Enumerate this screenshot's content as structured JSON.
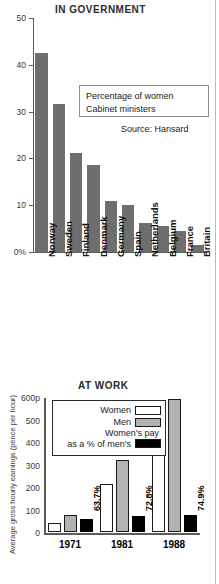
{
  "chart_data": [
    {
      "type": "bar",
      "title": "IN GOVERNMENT",
      "categories": [
        "Norway",
        "Sweden",
        "Finland",
        "Denmark",
        "Germany",
        "Spain",
        "Netherlands",
        "Belgium",
        "France",
        "Britain"
      ],
      "values": [
        42.5,
        31.7,
        21.2,
        18.5,
        10.9,
        10.0,
        6.2,
        5.5,
        4.5,
        1.4
      ],
      "ylim": [
        0,
        50
      ],
      "yticks": [
        "0%",
        "10",
        "20",
        "30",
        "40",
        "50"
      ],
      "ytick_values": [
        0,
        10,
        20,
        30,
        40,
        50
      ],
      "xlabel": "",
      "ylabel": "",
      "grid": false,
      "annotation": "Percentage of women Cabinet ministers",
      "annotation_line1": "Percentage of women",
      "annotation_line2": "Cabinet ministers",
      "source": "Source: Hansard",
      "bar_color": "#6e6e6e"
    },
    {
      "type": "bar",
      "title": "AT WORK",
      "categories": [
        "1971",
        "1981",
        "1988"
      ],
      "ylabel": "Average gross hourly earnings (pence per hour)",
      "ylim": [
        0,
        600
      ],
      "yticks": [
        "0",
        "100",
        "200",
        "300",
        "400",
        "500",
        "600p"
      ],
      "ytick_values": [
        0,
        100,
        200,
        300,
        400,
        500,
        600
      ],
      "grid": false,
      "legend_position": "top-center",
      "series": [
        {
          "name": "Women",
          "values": [
            42,
            215,
            430
          ],
          "color": "#ffffff"
        },
        {
          "name": "Men",
          "values": [
            76,
            320,
            590
          ],
          "color": "#b3b3b3"
        },
        {
          "name": "Women's pay as a % of men's",
          "values": [
            63.7,
            72.8,
            74.9
          ],
          "color": "#000000",
          "display": [
            "63.7%",
            "72.8%",
            "74.9%"
          ],
          "plotted_as_pence": [
            60,
            73,
            75
          ]
        }
      ],
      "legend": [
        {
          "label": "Women",
          "swatch": "white"
        },
        {
          "label": "Men",
          "swatch": "gray"
        },
        {
          "label_line1": "Women's pay",
          "label_line2": "as a % of men's",
          "swatch": "black"
        }
      ]
    }
  ]
}
